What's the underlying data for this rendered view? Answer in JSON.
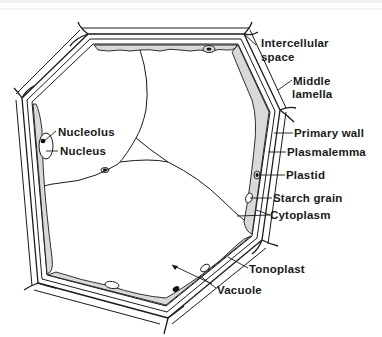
{
  "diagram": {
    "type": "labeled-anatomical-diagram",
    "colors": {
      "ink": "#1a1a1a",
      "cytoplasm_fill": "#d9d9d9",
      "background": "#ffffff"
    },
    "labels": [
      {
        "id": "intercellular-space",
        "lines": [
          "Intercellular",
          "space"
        ]
      },
      {
        "id": "middle-lamella",
        "lines": [
          "Middle",
          "lamella"
        ]
      },
      {
        "id": "primary-wall",
        "lines": [
          "Primary wall"
        ]
      },
      {
        "id": "plasmalemma",
        "lines": [
          "Plasmalemma"
        ]
      },
      {
        "id": "plastid",
        "lines": [
          "Plastid"
        ]
      },
      {
        "id": "starch-grain",
        "lines": [
          "Starch grain"
        ]
      },
      {
        "id": "cytoplasm",
        "lines": [
          "Cytoplasm"
        ]
      },
      {
        "id": "tonoplast",
        "lines": [
          "Tonoplast"
        ]
      },
      {
        "id": "vacuole",
        "lines": [
          "Vacuole"
        ]
      },
      {
        "id": "nucleolus",
        "lines": [
          "Nucleolus"
        ]
      },
      {
        "id": "nucleus",
        "lines": [
          "Nucleus"
        ]
      }
    ]
  }
}
